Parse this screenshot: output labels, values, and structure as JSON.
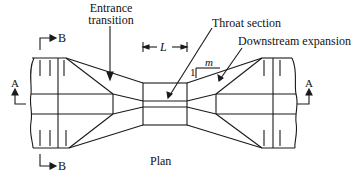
{
  "diagram": {
    "type": "flume-plan-view",
    "caption": "Plan",
    "labels": {
      "entrance_line1": "Entrance",
      "entrance_line2": "transition",
      "throat": "Throat section",
      "downstream": "Downstream expansion",
      "length": "L",
      "slope_rise": "1",
      "slope_run": "m",
      "section_b_top": "B",
      "section_b_bottom": "B",
      "section_a_left": "A",
      "section_a_right": "A"
    },
    "colors": {
      "line": "#1a1a1a",
      "background": "#ffffff"
    }
  }
}
